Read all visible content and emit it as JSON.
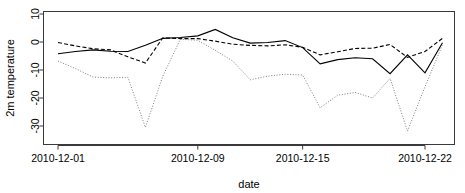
{
  "chart_data": {
    "type": "line",
    "title": "",
    "xlabel": "date",
    "ylabel": "2m temperature",
    "xlim": [
      "2010-12-01",
      "2010-12-23"
    ],
    "ylim": [
      -34,
      11
    ],
    "grid": false,
    "legend": "none",
    "y_ticks": [
      10,
      0,
      -10,
      -20,
      -30
    ],
    "y_tick_labels": [
      "10",
      "0",
      "-10",
      "-20",
      "-30"
    ],
    "x_ticks": [
      "2010-12-01",
      "2010-12-09",
      "2010-12-15",
      "2010-12-22"
    ],
    "x_tick_labels": [
      "2010-12-01",
      "2010-12-09",
      "2010-12-15",
      "2010-12-22"
    ],
    "x": [
      "2010-12-01",
      "2010-12-02",
      "2010-12-03",
      "2010-12-04",
      "2010-12-05",
      "2010-12-06",
      "2010-12-07",
      "2010-12-08",
      "2010-12-09",
      "2010-12-10",
      "2010-12-11",
      "2010-12-12",
      "2010-12-13",
      "2010-12-14",
      "2010-12-15",
      "2010-12-16",
      "2010-12-17",
      "2010-12-18",
      "2010-12-19",
      "2010-12-20",
      "2010-12-21",
      "2010-12-22",
      "2010-12-23"
    ],
    "series": [
      {
        "name": "series-solid",
        "style": "solid",
        "color": "#000000",
        "values": [
          -4.2,
          -3.4,
          -2.8,
          -3.3,
          -3.4,
          -1.2,
          1.3,
          1.6,
          2.2,
          4.5,
          1.5,
          -0.4,
          -0.2,
          0.5,
          -2.0,
          -7.8,
          -6.3,
          -5.6,
          -6.0,
          -11.3,
          -4.6,
          -11.0,
          -0.3
        ]
      },
      {
        "name": "series-dashed",
        "style": "dashed",
        "color": "#000000",
        "values": [
          -0.2,
          -1.4,
          -2.4,
          -2.8,
          -5.3,
          -7.5,
          1.5,
          1.2,
          1.2,
          0.3,
          -0.8,
          -1.2,
          -1.4,
          -1.0,
          -1.9,
          -4.6,
          -3.5,
          -2.3,
          -2.2,
          -0.9,
          -5.5,
          -3.4,
          1.3
        ]
      },
      {
        "name": "series-dotted",
        "style": "dotted",
        "color": "#7d7d7d",
        "values": [
          -6.8,
          -9.5,
          -12.5,
          -12.8,
          -12.6,
          -30.5,
          -12.2,
          1.0,
          0.6,
          -3.0,
          -6.8,
          -13.5,
          -12.2,
          -11.5,
          -11.8,
          -23.5,
          -19.0,
          -18.0,
          -20.0,
          -13.0,
          -31.8,
          -16.0,
          -1.0
        ]
      }
    ]
  },
  "axis": {
    "ylabel": "2m temperature",
    "xlabel": "date"
  }
}
